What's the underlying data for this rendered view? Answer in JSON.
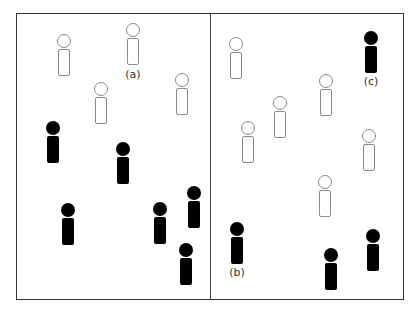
{
  "diagram": {
    "panels": [
      {
        "name": "left-panel",
        "figures": [
          {
            "style": "hollow",
            "x": 56,
            "y": 34
          },
          {
            "style": "hollow",
            "x": 125,
            "y": 23
          },
          {
            "style": "hollow",
            "x": 93,
            "y": 82
          },
          {
            "style": "hollow",
            "x": 174,
            "y": 73
          },
          {
            "style": "solid",
            "x": 45,
            "y": 121
          },
          {
            "style": "solid",
            "x": 115,
            "y": 142
          },
          {
            "style": "solid",
            "x": 60,
            "y": 203
          },
          {
            "style": "solid",
            "x": 152,
            "y": 202
          },
          {
            "style": "solid",
            "x": 186,
            "y": 186
          },
          {
            "style": "solid",
            "x": 178,
            "y": 243
          }
        ]
      },
      {
        "name": "right-panel",
        "figures": [
          {
            "style": "hollow",
            "x": 228,
            "y": 37
          },
          {
            "style": "hollow",
            "x": 272,
            "y": 96
          },
          {
            "style": "hollow",
            "x": 318,
            "y": 74
          },
          {
            "style": "hollow",
            "x": 240,
            "y": 121
          },
          {
            "style": "hollow",
            "x": 361,
            "y": 129
          },
          {
            "style": "hollow",
            "x": 317,
            "y": 175
          },
          {
            "style": "solid",
            "x": 363,
            "y": 31
          },
          {
            "style": "solid",
            "x": 229,
            "y": 222
          },
          {
            "style": "solid",
            "x": 323,
            "y": 248
          },
          {
            "style": "solid",
            "x": 365,
            "y": 229
          }
        ]
      }
    ],
    "labels": [
      {
        "text": "(a)",
        "x": 121,
        "y": 68
      },
      {
        "text": "(b)",
        "x": 225,
        "y": 266
      },
      {
        "text": "(c)",
        "x": 359,
        "y": 75
      }
    ],
    "colors": {
      "solid": "#000000",
      "hollow_stroke": "#8a8a8a",
      "frame": "#333333"
    }
  }
}
